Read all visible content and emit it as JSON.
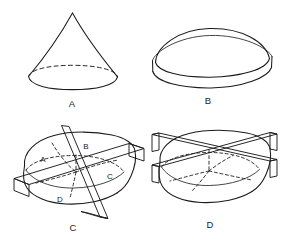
{
  "figure": {
    "background_color": "#ffffff",
    "line_color": "#1b1b1b",
    "width": 285,
    "height": 243
  },
  "panels": [
    {
      "id": "panel-a",
      "caption": "A",
      "caption_x": 72,
      "caption_y": 104,
      "shape": "cone",
      "description": "Right circular cone seen from slightly above, apex at top, elliptical base with dashed rear half"
    },
    {
      "id": "panel-b",
      "caption": "B",
      "caption_x": 208,
      "caption_y": 101,
      "shape": "dome-on-rim",
      "description": "Rounded dome resting on a short cylindrical rim, elliptical top edge"
    },
    {
      "id": "panel-c",
      "caption": "C",
      "caption_x": 73,
      "caption_y": 228,
      "shape": "blob-two-planes-quadrants",
      "description": "Irregular rounded solid cut by a steeply tilted plane and a near-horizontal plane, dividing it into four labelled quadrants",
      "region_labels": [
        {
          "label": "A",
          "x": 43,
          "y": 160
        },
        {
          "label": "B",
          "x": 86,
          "y": 147
        },
        {
          "label": "C",
          "x": 110,
          "y": 177
        },
        {
          "label": "D",
          "x": 60,
          "y": 200
        }
      ]
    },
    {
      "id": "panel-d",
      "caption": "D",
      "caption_x": 210,
      "caption_y": 225,
      "shape": "blob-two-crossing-planes",
      "description": "Same irregular rounded solid cut by two planes crossing in an X, with dashed hidden intersection curves",
      "region_labels": []
    }
  ]
}
